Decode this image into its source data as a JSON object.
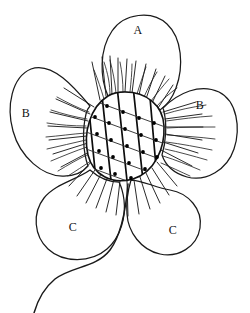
{
  "figure": {
    "background_color": "#ffffff",
    "line_color": "#1a1a1a",
    "width": 250,
    "height": 313
  },
  "labels": {
    "top_petal": "A",
    "left_petal": "B",
    "right_petal": "B",
    "lower_left_petal": "C",
    "lower_right_petal": "C"
  },
  "parts": {
    "center": "flower-center-disc",
    "stem": "flower-stem",
    "petal_count": 5
  }
}
